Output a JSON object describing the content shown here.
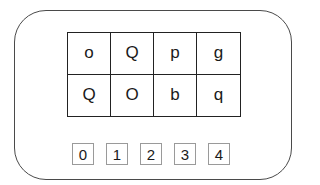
{
  "puzzle": {
    "grid": {
      "rows": [
        [
          "o",
          "Q",
          "p",
          "g"
        ],
        [
          "Q",
          "O",
          "b",
          "q"
        ]
      ]
    },
    "options": [
      "0",
      "1",
      "2",
      "3",
      "4"
    ]
  }
}
